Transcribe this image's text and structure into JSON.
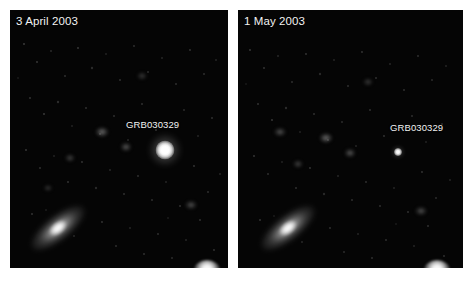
{
  "figure": {
    "name": "grb-afterglow-comparison",
    "background_color": "#ffffff",
    "panel_background_color": "#000000",
    "label_color": "#f2f2f2"
  },
  "panels": [
    {
      "id": "left",
      "date_label": "3 April 2003",
      "object_label": "GRB030329",
      "source_state": "bright afterglow"
    },
    {
      "id": "right",
      "date_label": "1 May 2003",
      "object_label": "GRB030329",
      "source_state": "faded afterglow"
    }
  ]
}
